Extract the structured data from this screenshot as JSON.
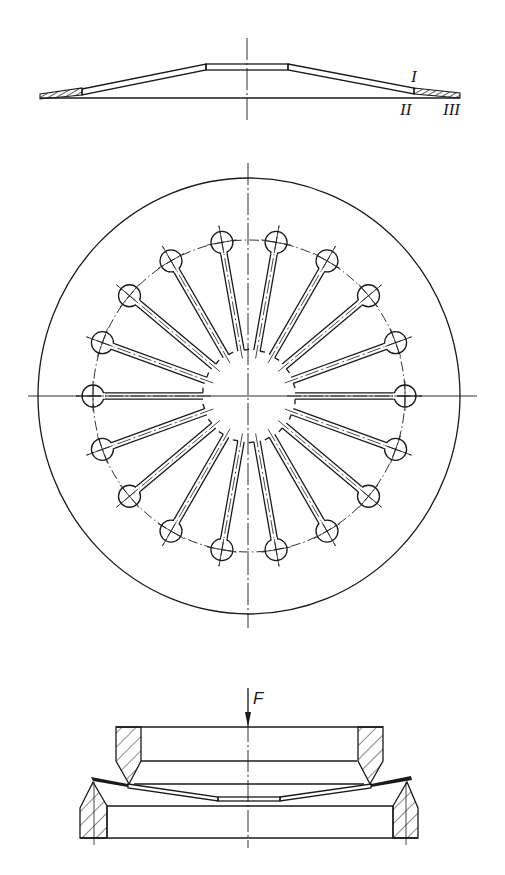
{
  "figure": {
    "type": "technical-drawing",
    "colors": {
      "ink": "#1a1a1a",
      "background": "#ffffff"
    }
  },
  "side_view": {
    "labels": {
      "zone_1": "I",
      "zone_2": "II",
      "zone_3": "III"
    }
  },
  "plan_view": {
    "slot_count": 18,
    "outer_rx": 211,
    "outer_ry": 218,
    "hole_ring_radius": 156,
    "hole_radius": 11,
    "hub_radius": 44
  },
  "test_fixture_view": {
    "force_label": "F"
  }
}
